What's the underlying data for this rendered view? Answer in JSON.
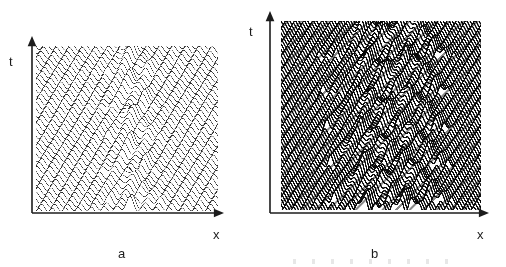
{
  "figure": {
    "width": 506,
    "height": 267,
    "background": "#ffffff",
    "ink_color": "#1c1c1c"
  },
  "panels": [
    {
      "id": "a",
      "label": "a",
      "label_pos": {
        "x": 118,
        "y": 247
      },
      "axes": {
        "y_axis_label": "t",
        "y_label_pos": {
          "x": 9,
          "y": 55
        },
        "x_axis_label": "x",
        "x_label_pos": {
          "x": 213,
          "y": 228
        },
        "origin": {
          "x": 32,
          "y": 213
        },
        "y_axis_top": {
          "x": 32,
          "y": 36
        },
        "x_axis_right": {
          "x": 224,
          "y": 213
        },
        "line_width": 1.6,
        "arrow_size": 7
      },
      "plot_area": {
        "x": 36,
        "y": 46,
        "width": 182,
        "height": 165
      },
      "render": {
        "style": "thin-lines",
        "traces": 42,
        "samples": 520,
        "line_width": 0.55,
        "stroke": "#2b2b2b",
        "fill": "#ffffff",
        "hidden_line_removal": true,
        "carrier_wavelength_px": 13.0,
        "carrier_amplitude_px": 3.4,
        "envelope_amplitude_px": 7.0,
        "caustic_slope": 0.78,
        "caustic_centers": [
          0.5
        ],
        "row_pitch_px": 4.0
      }
    },
    {
      "id": "b",
      "label": "b",
      "label_pos": {
        "x": 371,
        "y": 247
      },
      "axes": {
        "y_axis_label": "t",
        "y_label_pos": {
          "x": 249,
          "y": 25
        },
        "x_axis_label": "x",
        "x_label_pos": {
          "x": 477,
          "y": 228
        },
        "origin": {
          "x": 270,
          "y": 213
        },
        "y_axis_top": {
          "x": 270,
          "y": 11
        },
        "x_axis_right": {
          "x": 489,
          "y": 213
        },
        "line_width": 1.6,
        "arrow_size": 7
      },
      "plot_area": {
        "x": 281,
        "y": 21,
        "width": 200,
        "height": 189
      },
      "render": {
        "style": "thick-bands",
        "traces": 74,
        "samples": 620,
        "line_width": 1.35,
        "stroke": "#0d0d0d",
        "fill": "#ffffff",
        "hidden_line_removal": true,
        "carrier_wavelength_px": 9.0,
        "carrier_amplitude_px": 3.0,
        "envelope_amplitude_px": 8.5,
        "caustic_slope": 0.95,
        "caustic_centers": [
          0.42,
          0.63
        ],
        "row_pitch_px": 2.55
      }
    }
  ],
  "caption_residue": {
    "visible": true,
    "legible": false,
    "note": "cropped line of text at bottom edge"
  }
}
